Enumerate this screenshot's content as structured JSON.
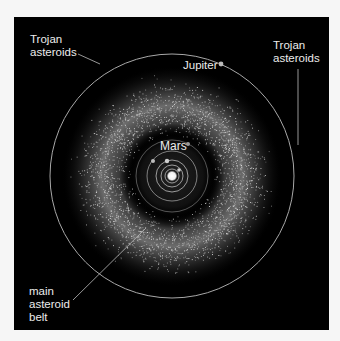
{
  "diagram": {
    "colors": {
      "background_outer": "#f6f6f6",
      "space": "#000000",
      "orbit": "#bdbdbd",
      "label": "#ececec",
      "asteroid": "#d9d9d9",
      "sun": "#ffffff"
    },
    "labels": {
      "trojan_left": {
        "line1": "Trojan",
        "line2": "asteroids"
      },
      "trojan_right": {
        "line1": "Trojan",
        "line2": "asteroids"
      },
      "jupiter": "Jupiter",
      "mars": "Mars",
      "main_belt": {
        "line1": "main",
        "line2": "asteroid",
        "line3": "belt"
      }
    },
    "center": {
      "x": 172,
      "y": 176
    },
    "orbits": [
      {
        "name": "mercury-orbit",
        "r": 7
      },
      {
        "name": "venus-orbit",
        "r": 11
      },
      {
        "name": "earth-orbit",
        "r": 16
      },
      {
        "name": "inner-orbit-4",
        "r": 25
      },
      {
        "name": "mars-orbit",
        "r": 36
      },
      {
        "name": "jupiter-orbit",
        "r": 122
      }
    ],
    "belt": {
      "inner_r": 44,
      "outer_r": 104,
      "peak_r": 70
    }
  }
}
